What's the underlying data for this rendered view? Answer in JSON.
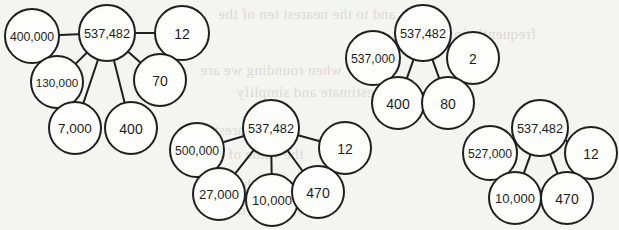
{
  "page": {
    "background_color": "#f4f4f1",
    "ink_color": "#1f1f1f",
    "node_fill": "#fdfdfc",
    "ghost_text_color": "#d9d9d6"
  },
  "background_ghost_text": [
    {
      "text": "and to the nearest ten of the",
      "x": 218,
      "y": 6,
      "size": 15
    },
    {
      "text": "frequently in the",
      "x": 430,
      "y": 26,
      "size": 15
    },
    {
      "text": "when rounding we are",
      "x": 200,
      "y": 62,
      "size": 15
    },
    {
      "text": "to estimate and simplify",
      "x": 236,
      "y": 84,
      "size": 15
    },
    {
      "text": "to the nearest",
      "x": 214,
      "y": 122,
      "size": 15
    },
    {
      "text": "the value of the",
      "x": 204,
      "y": 146,
      "size": 15
    },
    {
      "text": "number to the",
      "x": 236,
      "y": 176,
      "size": 15
    },
    {
      "text": "when the digit",
      "x": 216,
      "y": 202,
      "size": 15
    }
  ],
  "diagrams": [
    {
      "id": "number-bond-1",
      "center": {
        "label": "537,482",
        "cx": 107,
        "cy": 33,
        "r": 28
      },
      "leaves": [
        {
          "label": "400,000",
          "cx": 32,
          "cy": 36,
          "r": 27,
          "connector": true
        },
        {
          "label": "12",
          "cx": 182,
          "cy": 33,
          "r": 27,
          "connector": true
        },
        {
          "label": "130,000",
          "cx": 57,
          "cy": 82,
          "r": 26,
          "connector": true
        },
        {
          "label": "70",
          "cx": 160,
          "cy": 80,
          "r": 26,
          "connector": true
        },
        {
          "label": "7,000",
          "cx": 75,
          "cy": 128,
          "r": 26,
          "connector": true
        },
        {
          "label": "400",
          "cx": 131,
          "cy": 128,
          "r": 26,
          "connector": true
        }
      ]
    },
    {
      "id": "number-bond-2",
      "center": {
        "label": "537,482",
        "cx": 271,
        "cy": 128,
        "r": 28
      },
      "leaves": [
        {
          "label": "500,000",
          "cx": 197,
          "cy": 150,
          "r": 27,
          "connector": true
        },
        {
          "label": "12",
          "cx": 345,
          "cy": 148,
          "r": 26,
          "connector": true
        },
        {
          "label": "27,000",
          "cx": 219,
          "cy": 194,
          "r": 26,
          "connector": true
        },
        {
          "label": "10,000",
          "cx": 272,
          "cy": 200,
          "r": 26,
          "connector": true
        },
        {
          "label": "470",
          "cx": 318,
          "cy": 192,
          "r": 26,
          "connector": true
        }
      ]
    },
    {
      "id": "number-bond-3",
      "center": {
        "label": "537,482",
        "cx": 423,
        "cy": 33,
        "r": 28
      },
      "leaves": [
        {
          "label": "537,000",
          "cx": 373,
          "cy": 58,
          "r": 27,
          "connector": true
        },
        {
          "label": "2",
          "cx": 473,
          "cy": 58,
          "r": 26,
          "connector": true
        },
        {
          "label": "400",
          "cx": 398,
          "cy": 103,
          "r": 26,
          "connector": true
        },
        {
          "label": "80",
          "cx": 448,
          "cy": 103,
          "r": 26,
          "connector": true
        }
      ]
    },
    {
      "id": "number-bond-4",
      "center": {
        "label": "537,482",
        "cx": 540,
        "cy": 128,
        "r": 28
      },
      "leaves": [
        {
          "label": "527,000",
          "cx": 490,
          "cy": 153,
          "r": 27,
          "connector": true
        },
        {
          "label": "12",
          "cx": 591,
          "cy": 153,
          "r": 26,
          "connector": true
        },
        {
          "label": "10,000",
          "cx": 515,
          "cy": 198,
          "r": 26,
          "connector": true
        },
        {
          "label": "470",
          "cx": 567,
          "cy": 198,
          "r": 26,
          "connector": true
        }
      ]
    }
  ]
}
